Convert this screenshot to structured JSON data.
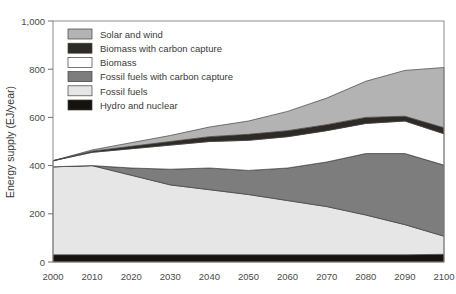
{
  "chart_data": {
    "type": "area",
    "title": "",
    "xlabel": "",
    "ylabel": "Energy supply (EJ/year)",
    "x": [
      2000,
      2010,
      2020,
      2030,
      2040,
      2050,
      2060,
      2070,
      2080,
      2090,
      2100
    ],
    "xtick_labels": [
      "2000",
      "2010",
      "2020",
      "2030",
      "2040",
      "2050",
      "2060",
      "2070",
      "2080",
      "2090",
      "2100"
    ],
    "ytick_values": [
      0,
      200,
      400,
      600,
      800,
      1000
    ],
    "ytick_labels": [
      "0",
      "200",
      "400",
      "600",
      "800",
      "1,000"
    ],
    "xlim": [
      2000,
      2100
    ],
    "ylim": [
      0,
      1000
    ],
    "grid": false,
    "stacked": true,
    "legend_position": "top-left",
    "series": [
      {
        "name": "Hydro and nuclear",
        "color": "#16130f",
        "values": [
          30,
          30,
          30,
          30,
          30,
          30,
          30,
          30,
          30,
          30,
          32
        ]
      },
      {
        "name": "Fossil fuels",
        "color": "#e6e6e6",
        "values": [
          365,
          370,
          330,
          290,
          270,
          250,
          225,
          200,
          165,
          125,
          75
        ]
      },
      {
        "name": "Fossil fuels with carbon capture",
        "color": "#7d7d7d",
        "values": [
          0,
          0,
          30,
          65,
          90,
          100,
          135,
          185,
          255,
          295,
          295
        ]
      },
      {
        "name": "Biomass",
        "color": "#ffffff",
        "values": [
          25,
          55,
          80,
          100,
          110,
          125,
          130,
          130,
          125,
          135,
          130
        ]
      },
      {
        "name": "Biomass with carbon capture",
        "color": "#2e2b27",
        "values": [
          0,
          5,
          10,
          15,
          20,
          25,
          25,
          25,
          25,
          20,
          25
        ]
      },
      {
        "name": "Solar and wind",
        "color": "#b3b3b3",
        "values": [
          0,
          5,
          15,
          25,
          40,
          55,
          80,
          110,
          150,
          190,
          250
        ]
      }
    ],
    "legend_order": [
      "Solar and wind",
      "Biomass with carbon capture",
      "Biomass",
      "Fossil fuels with carbon capture",
      "Fossil fuels",
      "Hydro and nuclear"
    ]
  }
}
